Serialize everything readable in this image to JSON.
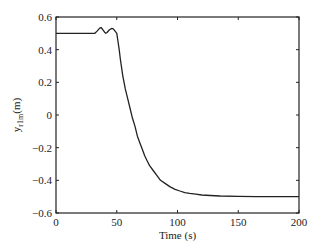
{
  "chart_data": {
    "type": "line",
    "title": "",
    "xlabel": "Time (s)",
    "ylabel_main": "y",
    "ylabel_sub": "r1m",
    "ylabel_unit": "(m)",
    "ylabel": "y_r1m(m)",
    "xlim": [
      0,
      200
    ],
    "ylim": [
      -0.6,
      0.6
    ],
    "xticks": [
      0,
      50,
      100,
      150,
      200
    ],
    "xtick_labels": [
      "0",
      "50",
      "100",
      "150",
      "200"
    ],
    "yticks": [
      0.6,
      0.4,
      0.2,
      0,
      -0.2,
      -0.4,
      -0.6
    ],
    "ytick_labels": [
      "0.6",
      "0.4",
      "0.2",
      "0",
      "−0.2",
      "−0.4",
      "−0.6"
    ],
    "grid": false,
    "legend": null,
    "series": [
      {
        "name": "y_r1m",
        "color": "#222222",
        "x": [
          0,
          32,
          34,
          36,
          37,
          38,
          40,
          41,
          42,
          44,
          46,
          47,
          48,
          50,
          51,
          52,
          53,
          55,
          57,
          59,
          61,
          63,
          65,
          67,
          69,
          71,
          73,
          75,
          77,
          80,
          83,
          86,
          90,
          94,
          98,
          102,
          106,
          110,
          115,
          120,
          127,
          135,
          150,
          165,
          180,
          200
        ],
        "y": [
          0.5,
          0.5,
          0.515,
          0.532,
          0.536,
          0.528,
          0.507,
          0.5,
          0.505,
          0.522,
          0.53,
          0.528,
          0.52,
          0.5,
          0.45,
          0.4,
          0.34,
          0.24,
          0.16,
          0.1,
          0.04,
          -0.02,
          -0.07,
          -0.13,
          -0.17,
          -0.21,
          -0.25,
          -0.28,
          -0.31,
          -0.34,
          -0.37,
          -0.4,
          -0.42,
          -0.44,
          -0.455,
          -0.465,
          -0.475,
          -0.48,
          -0.485,
          -0.49,
          -0.493,
          -0.496,
          -0.498,
          -0.5,
          -0.5,
          -0.5
        ]
      }
    ]
  }
}
